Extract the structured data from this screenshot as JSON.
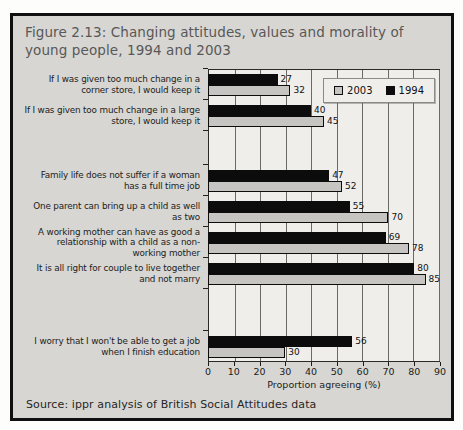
{
  "figure": {
    "title": "Figure 2.13: Changing attitudes, values and morality of young people, 1994 and 2003",
    "source": "Source: ippr analysis of British Social Attitudes data"
  },
  "colors": {
    "bar_1994": "#0c0c0c",
    "bar_2003": "#c6c5c2",
    "plot_background": "#efeeeb",
    "figure_background": "#d7d6d2",
    "gridline": "#6b6965"
  },
  "chart_data": {
    "type": "bar",
    "orientation": "horizontal",
    "title": "Figure 2.13: Changing attitudes, values and morality of young people, 1994 and 2003",
    "xlabel": "Proportion agreeing (%)",
    "ylabel": "",
    "xlim": [
      0,
      90
    ],
    "xticks": [
      0,
      10,
      20,
      30,
      40,
      50,
      60,
      70,
      80,
      90
    ],
    "grid": true,
    "legend_position": "top-right",
    "legend": [
      "2003",
      "1994"
    ],
    "categories": [
      "If I was given too much change in a corner store, I would keep it",
      "If I was given too much change in a large store, I would keep it",
      "Family life does not suffer if a woman has a full time job",
      "One parent can bring up a child as well as two",
      "A working mother can have as good a relationship with a child as a non-working mother",
      "It is all right for couple to live together and not marry",
      "I worry that I won't be able to get a job when I finish education"
    ],
    "series": [
      {
        "name": "1994",
        "color": "#0c0c0c",
        "values": [
          27,
          40,
          47,
          55,
          69,
          80,
          56
        ]
      },
      {
        "name": "2003",
        "color": "#c6c5c2",
        "values": [
          32,
          45,
          52,
          70,
          78,
          85,
          30
        ]
      }
    ],
    "category_gaps_after": [
      1,
      5
    ]
  }
}
